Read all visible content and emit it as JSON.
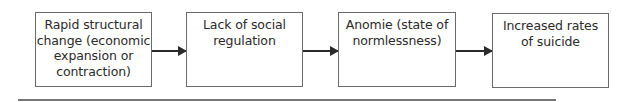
{
  "diagram": {
    "type": "flowchart",
    "direction": "left-to-right",
    "nodes": [
      {
        "id": "n1",
        "label": "Rapid structural change (economic expansion or contraction)",
        "lines": [
          "Rapid structural",
          "change (economic",
          "expansion or",
          "contraction)"
        ]
      },
      {
        "id": "n2",
        "label": "Lack of social regulation",
        "lines": [
          "Lack of social",
          "regulation"
        ]
      },
      {
        "id": "n3",
        "label": "Anomie (state of normlessness)",
        "lines": [
          "Anomie (state of",
          "normlessness)"
        ]
      },
      {
        "id": "n4",
        "label": "Increased rates of suicide",
        "lines": [
          "Increased rates",
          "of suicide"
        ]
      }
    ],
    "edges": [
      {
        "from": "n1",
        "to": "n2"
      },
      {
        "from": "n2",
        "to": "n3"
      },
      {
        "from": "n3",
        "to": "n4"
      }
    ]
  }
}
